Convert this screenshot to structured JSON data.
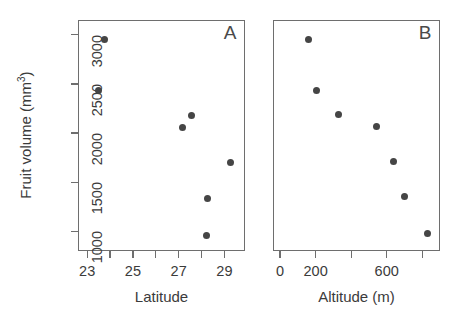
{
  "figure": {
    "y_axis": {
      "title_main": "Fruit volume (mm",
      "title_sup": "3",
      "title_close": ")",
      "ticks": [
        1000,
        1500,
        2000,
        2500,
        3000
      ],
      "tick_labels": [
        "1000",
        "1500",
        "2000",
        "2500",
        "3000"
      ],
      "range": [
        800,
        3150
      ]
    },
    "panels": [
      {
        "tag": "A",
        "xlabel": "Latitude",
        "x_range": [
          22.6,
          29.9
        ],
        "x_ticks": [
          23,
          24,
          25,
          26,
          27,
          28,
          29
        ],
        "x_tick_labels": [
          "23",
          "",
          "25",
          "",
          "27",
          "",
          "29"
        ]
      },
      {
        "tag": "B",
        "xlabel": "Altitude (m)",
        "x_range": [
          -40,
          900
        ],
        "x_ticks": [
          0,
          200,
          400,
          600,
          800
        ],
        "x_tick_labels": [
          "0",
          "200",
          "",
          "600",
          ""
        ]
      }
    ]
  },
  "chart_data": [
    {
      "type": "scatter",
      "panel": "A",
      "title": "",
      "xlabel": "Latitude",
      "ylabel": "Fruit volume (mm3)",
      "xlim": [
        22.6,
        29.9
      ],
      "ylim": [
        800,
        3150
      ],
      "grid": false,
      "legend": "none",
      "marker": "filled-circle",
      "marker_color": "#454545",
      "x": [
        23.75,
        23.5,
        27.15,
        27.55,
        28.25,
        29.25,
        28.2
      ],
      "y": [
        2950,
        2430,
        2060,
        2180,
        1330,
        1700,
        960
      ],
      "points": [
        {
          "x": 23.75,
          "y": 2950
        },
        {
          "x": 23.5,
          "y": 2430
        },
        {
          "x": 27.15,
          "y": 2060
        },
        {
          "x": 27.55,
          "y": 2180
        },
        {
          "x": 28.25,
          "y": 1330
        },
        {
          "x": 29.25,
          "y": 1700
        },
        {
          "x": 28.2,
          "y": 960
        }
      ]
    },
    {
      "type": "scatter",
      "panel": "B",
      "title": "",
      "xlabel": "Altitude (m)",
      "ylabel": "Fruit volume (mm3)",
      "xlim": [
        -40,
        900
      ],
      "ylim": [
        800,
        3150
      ],
      "grid": false,
      "legend": "none",
      "marker": "filled-circle",
      "marker_color": "#454545",
      "x": [
        160,
        205,
        330,
        545,
        640,
        700,
        830
      ],
      "y": [
        2950,
        2430,
        2190,
        2070,
        1710,
        1350,
        980
      ],
      "points": [
        {
          "x": 160,
          "y": 2950
        },
        {
          "x": 205,
          "y": 2430
        },
        {
          "x": 330,
          "y": 2190
        },
        {
          "x": 545,
          "y": 2070
        },
        {
          "x": 640,
          "y": 1710
        },
        {
          "x": 700,
          "y": 1350
        },
        {
          "x": 830,
          "y": 980
        }
      ]
    }
  ]
}
